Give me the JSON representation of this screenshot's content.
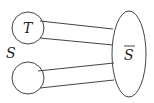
{
  "diagram": {
    "labels": {
      "top_circle": "T",
      "left_group": "S",
      "ellipse": "S"
    },
    "ellipse_label_overline": true,
    "stroke_color": "#333333"
  }
}
